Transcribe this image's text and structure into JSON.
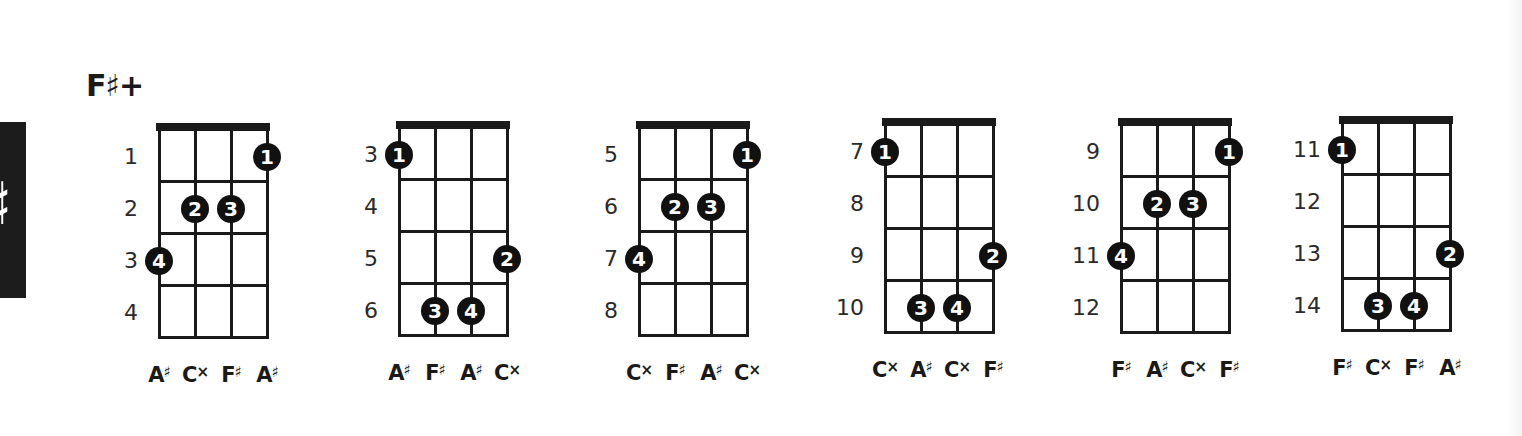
{
  "page": {
    "chord_title": "F♯+",
    "side_tab_glyph": "♯",
    "colors": {
      "ink": "#1a1a1a",
      "finger_fill": "#111111",
      "finger_text": "#ffffff",
      "tab_bg": "#1c1c1c"
    }
  },
  "diagrams": [
    {
      "position": {
        "left": 158,
        "top": 123
      },
      "fret_numbers": [
        "1",
        "2",
        "3",
        "4"
      ],
      "fingers": [
        {
          "label": "1",
          "string": 4,
          "fret": 1
        },
        {
          "label": "2",
          "string": 2,
          "fret": 2
        },
        {
          "label": "3",
          "string": 3,
          "fret": 2
        },
        {
          "label": "4",
          "string": 1,
          "fret": 3
        }
      ],
      "notes": [
        {
          "letter": "A",
          "acc": "♯"
        },
        {
          "letter": "C",
          "acc": "×"
        },
        {
          "letter": "F",
          "acc": "♯"
        },
        {
          "letter": "A",
          "acc": "♯"
        }
      ]
    },
    {
      "position": {
        "left": 398,
        "top": 121
      },
      "fret_numbers": [
        "3",
        "4",
        "5",
        "6"
      ],
      "fingers": [
        {
          "label": "1",
          "string": 1,
          "fret": 1
        },
        {
          "label": "2",
          "string": 4,
          "fret": 3
        },
        {
          "label": "3",
          "string": 2,
          "fret": 4
        },
        {
          "label": "4",
          "string": 3,
          "fret": 4
        }
      ],
      "notes": [
        {
          "letter": "A",
          "acc": "♯"
        },
        {
          "letter": "F",
          "acc": "♯"
        },
        {
          "letter": "A",
          "acc": "♯"
        },
        {
          "letter": "C",
          "acc": "×"
        }
      ]
    },
    {
      "position": {
        "left": 638,
        "top": 121
      },
      "fret_numbers": [
        "5",
        "6",
        "7",
        "8"
      ],
      "fingers": [
        {
          "label": "1",
          "string": 4,
          "fret": 1
        },
        {
          "label": "2",
          "string": 2,
          "fret": 2
        },
        {
          "label": "3",
          "string": 3,
          "fret": 2
        },
        {
          "label": "4",
          "string": 1,
          "fret": 3
        }
      ],
      "notes": [
        {
          "letter": "C",
          "acc": "×"
        },
        {
          "letter": "F",
          "acc": "♯"
        },
        {
          "letter": "A",
          "acc": "♯"
        },
        {
          "letter": "C",
          "acc": "×"
        }
      ]
    },
    {
      "position": {
        "left": 884,
        "top": 118
      },
      "fret_numbers": [
        "7",
        "8",
        "9",
        "10"
      ],
      "fingers": [
        {
          "label": "1",
          "string": 1,
          "fret": 1
        },
        {
          "label": "2",
          "string": 4,
          "fret": 3
        },
        {
          "label": "3",
          "string": 2,
          "fret": 4
        },
        {
          "label": "4",
          "string": 3,
          "fret": 4
        }
      ],
      "notes": [
        {
          "letter": "C",
          "acc": "×"
        },
        {
          "letter": "A",
          "acc": "♯"
        },
        {
          "letter": "C",
          "acc": "×"
        },
        {
          "letter": "F",
          "acc": "♯"
        }
      ]
    },
    {
      "position": {
        "left": 1120,
        "top": 118
      },
      "fret_numbers": [
        "9",
        "10",
        "11",
        "12"
      ],
      "fingers": [
        {
          "label": "1",
          "string": 4,
          "fret": 1
        },
        {
          "label": "2",
          "string": 2,
          "fret": 2
        },
        {
          "label": "3",
          "string": 3,
          "fret": 2
        },
        {
          "label": "4",
          "string": 1,
          "fret": 3
        }
      ],
      "notes": [
        {
          "letter": "F",
          "acc": "♯"
        },
        {
          "letter": "A",
          "acc": "♯"
        },
        {
          "letter": "C",
          "acc": "×"
        },
        {
          "letter": "F",
          "acc": "♯"
        }
      ]
    },
    {
      "position": {
        "left": 1341,
        "top": 116
      },
      "fret_numbers": [
        "11",
        "12",
        "13",
        "14"
      ],
      "fingers": [
        {
          "label": "1",
          "string": 1,
          "fret": 1
        },
        {
          "label": "2",
          "string": 4,
          "fret": 3
        },
        {
          "label": "3",
          "string": 2,
          "fret": 4
        },
        {
          "label": "4",
          "string": 3,
          "fret": 4
        }
      ],
      "notes": [
        {
          "letter": "F",
          "acc": "♯"
        },
        {
          "letter": "C",
          "acc": "×"
        },
        {
          "letter": "F",
          "acc": "♯"
        },
        {
          "letter": "A",
          "acc": "♯"
        }
      ]
    }
  ]
}
